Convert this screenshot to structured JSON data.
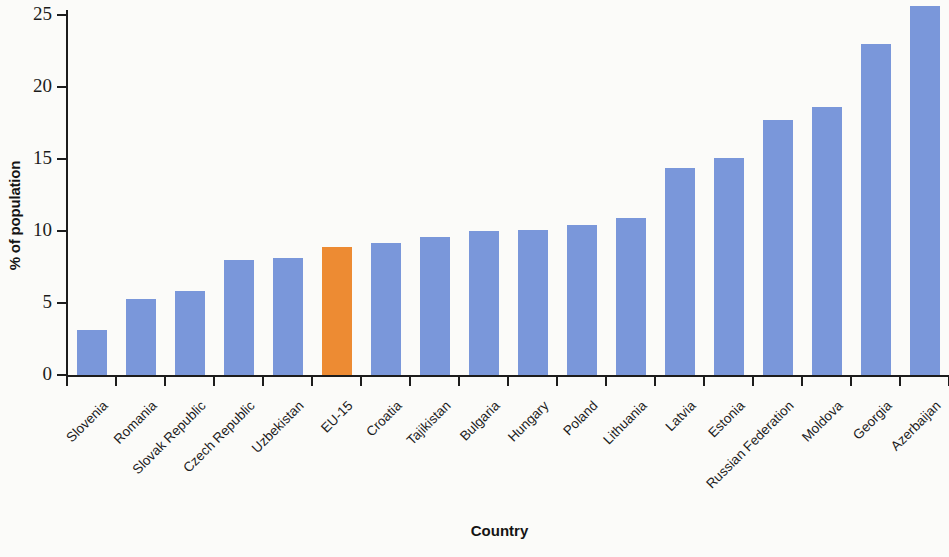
{
  "chart_data": {
    "type": "bar",
    "title": "",
    "xlabel": "Country",
    "ylabel": "% of population",
    "ylim": [
      0,
      25
    ],
    "yticks": [
      0,
      5,
      10,
      15,
      20,
      25
    ],
    "grid": false,
    "legend": null,
    "highlight_color": "#ed8b33",
    "series_color": "#7a97da",
    "highlight_category": "EU-15",
    "categories": [
      "Slovenia",
      "Romania",
      "Slovak Republic",
      "Czech Republic",
      "Uzbekistan",
      "EU-15",
      "Croatia",
      "Tajikistan",
      "Bulgaria",
      "Hungary",
      "Poland",
      "Lithuania",
      "Latvia",
      "Estonia",
      "Russian Federation",
      "Moldova",
      "Georgia",
      "Azerbaijan"
    ],
    "values": [
      3.1,
      5.3,
      5.8,
      8.0,
      8.1,
      8.9,
      9.2,
      9.6,
      10.0,
      10.1,
      10.4,
      10.9,
      14.4,
      15.1,
      17.7,
      18.6,
      23.0,
      25.6
    ]
  }
}
